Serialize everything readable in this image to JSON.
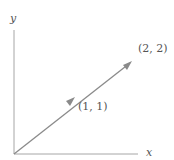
{
  "diagram": {
    "axes": {
      "x_label": "x",
      "y_label": "y",
      "color": "#a6a6a6"
    },
    "vector": {
      "from": [
        0,
        0
      ],
      "to": [
        2,
        2
      ],
      "color": "#8a8a8a"
    },
    "points": [
      {
        "label": "(1, 1)"
      },
      {
        "label": "(2, 2)"
      }
    ]
  }
}
